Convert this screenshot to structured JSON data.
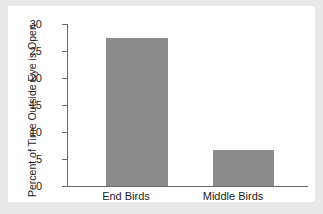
{
  "chart_data": {
    "type": "bar",
    "title": "",
    "subtitle": "",
    "xlabel": "",
    "ylabel": "Percent of Time Outside Eye is Open",
    "categories": [
      "End Birds",
      "Middle Birds"
    ],
    "values": [
      27.4,
      6.6
    ],
    "ylim": [
      0,
      30
    ],
    "yticks": [
      0,
      5,
      10,
      15,
      20,
      25,
      30
    ],
    "ytick_labels": [
      "0",
      "5",
      "10",
      "15",
      "20",
      "25",
      "30"
    ],
    "grid": false,
    "legend": null,
    "annotations": [],
    "colors": {
      "bar_fill": "#8c8c8c",
      "axis": "#6a6a6a",
      "text": "#1c1c1c",
      "plot_background": "#ffffff",
      "page_background": "#e8e8e8"
    }
  }
}
